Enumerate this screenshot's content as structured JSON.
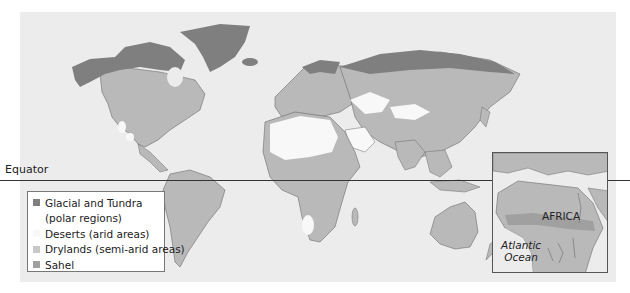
{
  "map": {
    "equator_label": "Equator",
    "colors": {
      "background": "#ffffff",
      "ocean": "#ececec",
      "glacial_tundra": "#7f7f7f",
      "deserts": "#f8f8f8",
      "drylands": "#b9b9b9",
      "sahel": "#a0a0a0",
      "border_lines": "#6b6b6b"
    }
  },
  "legend": {
    "items": [
      {
        "label": "Glacial and Tundra",
        "color": "#7f7f7f"
      },
      {
        "label": "(polar regions)",
        "color": null
      },
      {
        "label": "Deserts (arid areas)",
        "color": "#f8f8f8"
      },
      {
        "label": "Drylands (semi-arid areas)",
        "color": "#c8c8c8"
      },
      {
        "label": "Sahel",
        "color": "#a0a0a0"
      }
    ]
  },
  "inset": {
    "region_label": "AFRICA",
    "ocean_label_line1": "Atlantic",
    "ocean_label_line2": "Ocean"
  }
}
